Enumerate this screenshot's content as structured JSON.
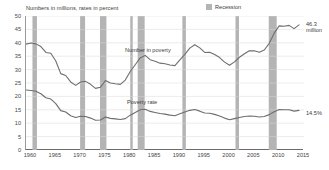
{
  "subtitle": "Numbers in millions, rates in percent",
  "legend": {
    "swatch_name": "recession-swatch",
    "label": "Recession",
    "color": "#b4b4b4"
  },
  "annotations": {
    "series_number_label": "Number in poverty",
    "series_rate_label": "Poverty rate",
    "end_number_label": "46.3 million",
    "end_rate_label": "14.5%"
  },
  "chart_data": {
    "type": "line",
    "title": "",
    "subtitle": "Numbers in millions, rates in percent",
    "xlabel": "",
    "ylabel": "",
    "xlim": [
      1959,
      2015
    ],
    "ylim": [
      0,
      50
    ],
    "yticks": [
      0,
      5,
      10,
      15,
      20,
      25,
      30,
      35,
      40,
      45,
      50
    ],
    "xticks": [
      1960,
      1965,
      1970,
      1975,
      1980,
      1985,
      1990,
      1995,
      2000,
      2005,
      2010,
      2015
    ],
    "xtick_labels": [
      "1960",
      "1965",
      "1970",
      "1975",
      "1980",
      "1985",
      "1990",
      "1995",
      "2000",
      "2005",
      "2010",
      "2015"
    ],
    "ytick_labels": [
      "0",
      "5",
      "10",
      "15",
      "20",
      "25",
      "30",
      "35",
      "40",
      "45",
      "50"
    ],
    "grid": true,
    "grid_axis": "y",
    "legend_position": "top-right",
    "line_color": "#6e6e6e",
    "recession_color": "#b4b4b4",
    "series": [
      {
        "name": "Number in poverty",
        "units": "millions",
        "end_label": "46.3 million",
        "x": [
          1959,
          1960,
          1961,
          1962,
          1963,
          1964,
          1965,
          1966,
          1967,
          1968,
          1969,
          1970,
          1971,
          1972,
          1973,
          1974,
          1975,
          1976,
          1977,
          1978,
          1979,
          1980,
          1981,
          1982,
          1983,
          1984,
          1985,
          1986,
          1987,
          1988,
          1989,
          1990,
          1991,
          1992,
          1993,
          1994,
          1995,
          1996,
          1997,
          1998,
          1999,
          2000,
          2001,
          2002,
          2003,
          2004,
          2005,
          2006,
          2007,
          2008,
          2009,
          2010,
          2011,
          2012,
          2013,
          2014
        ],
        "values": [
          39.5,
          39.9,
          39.6,
          38.6,
          36.4,
          36.1,
          33.2,
          28.5,
          27.8,
          25.4,
          24.1,
          25.4,
          25.6,
          24.5,
          23.0,
          23.4,
          25.9,
          25.0,
          24.7,
          24.5,
          26.1,
          29.3,
          31.8,
          34.4,
          35.3,
          33.7,
          33.1,
          32.4,
          32.2,
          31.7,
          31.5,
          33.6,
          35.7,
          38.0,
          39.3,
          38.1,
          36.4,
          36.5,
          35.6,
          34.5,
          32.8,
          31.6,
          32.9,
          34.6,
          35.9,
          37.0,
          37.0,
          36.5,
          37.3,
          39.8,
          43.6,
          46.3,
          46.2,
          46.5,
          45.3,
          46.7
        ]
      },
      {
        "name": "Poverty rate",
        "units": "percent",
        "end_label": "14.5%",
        "x": [
          1959,
          1960,
          1961,
          1962,
          1963,
          1964,
          1965,
          1966,
          1967,
          1968,
          1969,
          1970,
          1971,
          1972,
          1973,
          1974,
          1975,
          1976,
          1977,
          1978,
          1979,
          1980,
          1981,
          1982,
          1983,
          1984,
          1985,
          1986,
          1987,
          1988,
          1989,
          1990,
          1991,
          1992,
          1993,
          1994,
          1995,
          1996,
          1997,
          1998,
          1999,
          2000,
          2001,
          2002,
          2003,
          2004,
          2005,
          2006,
          2007,
          2008,
          2009,
          2010,
          2011,
          2012,
          2013,
          2014
        ],
        "values": [
          22.4,
          22.2,
          21.9,
          21.0,
          19.5,
          19.0,
          17.3,
          14.7,
          14.2,
          12.8,
          12.1,
          12.6,
          12.5,
          11.9,
          11.1,
          11.2,
          12.3,
          11.8,
          11.6,
          11.4,
          11.7,
          13.0,
          14.0,
          15.0,
          15.2,
          14.4,
          14.0,
          13.6,
          13.4,
          13.0,
          12.8,
          13.5,
          14.2,
          14.8,
          15.1,
          14.5,
          13.8,
          13.7,
          13.3,
          12.7,
          11.9,
          11.3,
          11.7,
          12.1,
          12.5,
          12.7,
          12.6,
          12.3,
          12.5,
          13.2,
          14.3,
          15.1,
          15.0,
          15.0,
          14.5,
          14.8
        ]
      }
    ],
    "recessions": [
      {
        "start": 1960.3,
        "end": 1961.2
      },
      {
        "start": 1969.9,
        "end": 1970.9
      },
      {
        "start": 1973.9,
        "end": 1975.2
      },
      {
        "start": 1980.0,
        "end": 1980.5
      },
      {
        "start": 1981.5,
        "end": 1982.9
      },
      {
        "start": 1990.5,
        "end": 1991.2
      },
      {
        "start": 2001.2,
        "end": 2001.9
      },
      {
        "start": 2007.9,
        "end": 2009.5
      }
    ]
  }
}
